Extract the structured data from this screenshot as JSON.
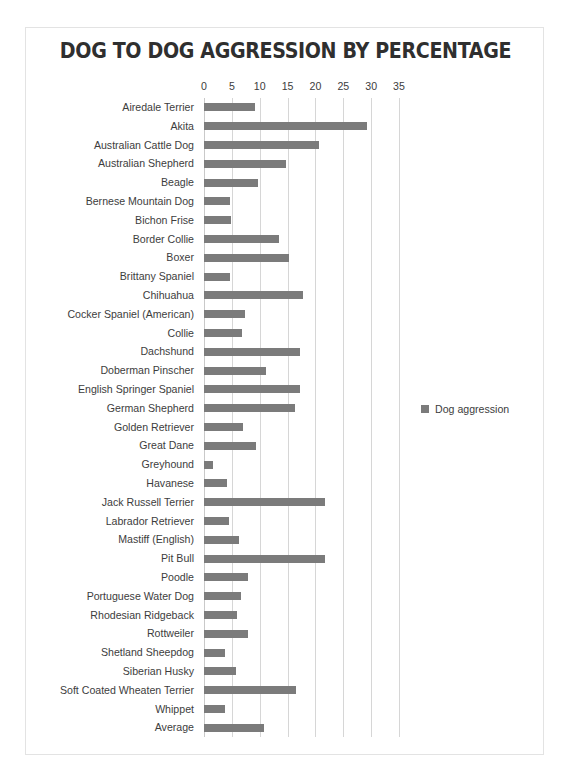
{
  "chart_data": {
    "type": "bar",
    "orientation": "horizontal",
    "title": "DOG TO DOG AGGRESSION BY PERCENTAGE",
    "xlabel": "",
    "ylabel": "",
    "xlim": [
      0,
      35
    ],
    "ticks": [
      0,
      5,
      10,
      15,
      20,
      25,
      30,
      35
    ],
    "grid": true,
    "legend": {
      "position": "right",
      "entries": [
        "Dog aggression"
      ],
      "swatch_color": "#7b7b7b"
    },
    "series_name": "Dog aggression",
    "bar_color": "#7b7b7b",
    "categories": [
      "Airedale Terrier",
      "Akita",
      "Australian Cattle Dog",
      "Australian Shepherd",
      "Beagle",
      "Bernese Mountain Dog",
      "Bichon Frise",
      "Border Collie",
      "Boxer",
      "Brittany Spaniel",
      "Chihuahua",
      "Cocker Spaniel (American)",
      "Collie",
      "Dachshund",
      "Doberman Pinscher",
      "English Springer Spaniel",
      "German Shepherd",
      "Golden Retriever",
      "Great Dane",
      "Greyhound",
      "Havanese",
      "Jack Russell Terrier",
      "Labrador Retriever",
      "Mastiff (English)",
      "Pit Bull",
      "Poodle",
      "Portuguese Water Dog",
      "Rhodesian Ridgeback",
      "Rottweiler",
      "Shetland Sheepdog",
      "Siberian Husky",
      "Soft Coated Wheaten Terrier",
      "Whippet",
      "Average"
    ],
    "values": [
      9.2,
      29.2,
      20.6,
      14.8,
      9.7,
      4.7,
      4.8,
      13.5,
      15.3,
      4.6,
      17.8,
      7.4,
      6.9,
      17.3,
      11.2,
      17.3,
      16.4,
      7.0,
      9.4,
      1.6,
      4.2,
      21.8,
      4.4,
      6.3,
      21.8,
      7.9,
      6.7,
      5.9,
      7.9,
      3.7,
      5.7,
      16.5,
      3.7,
      10.8
    ]
  },
  "frame": {
    "border_color": "#e3e3e3",
    "background": "#ffffff"
  }
}
